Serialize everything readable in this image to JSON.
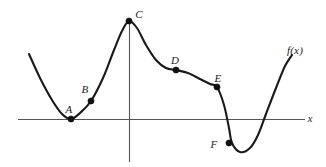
{
  "figure": {
    "background_color": "#ffffff",
    "curve_color": "#1a1a1a",
    "axis_color": "#555555",
    "point_color": "#111111",
    "function_label": "f(x)",
    "function_label_pos": {
      "x": 295,
      "y": 50
    },
    "x_axis_label": "x",
    "x_axis_label_pos": {
      "x": 310,
      "y": 119
    }
  },
  "chart_data": {
    "type": "line",
    "title": "",
    "xlabel": "x",
    "ylabel": "",
    "grid": false,
    "legend": "none",
    "series": [
      {
        "name": "f(x)",
        "description": "Smooth continuous curve descending steeply from upper left to a local minimum at A on the x-axis, rising through inflection point B to a local maximum at C on the y-axis, falling through inflection D to a plateau, descending through inflection E to a local minimum below the axis near F, then rising steeply to the upper right.",
        "points": [
          {
            "x": 29,
            "y": 54
          },
          {
            "x": 40,
            "y": 78
          },
          {
            "x": 52,
            "y": 100
          },
          {
            "x": 62,
            "y": 114
          },
          {
            "x": 71,
            "y": 119
          },
          {
            "x": 80,
            "y": 113
          },
          {
            "x": 91,
            "y": 101
          },
          {
            "x": 103,
            "y": 78
          },
          {
            "x": 114,
            "y": 50
          },
          {
            "x": 122,
            "y": 31
          },
          {
            "x": 129,
            "y": 21
          },
          {
            "x": 137,
            "y": 28
          },
          {
            "x": 146,
            "y": 45
          },
          {
            "x": 156,
            "y": 60
          },
          {
            "x": 166,
            "y": 68
          },
          {
            "x": 176,
            "y": 70
          },
          {
            "x": 188,
            "y": 73
          },
          {
            "x": 200,
            "y": 79
          },
          {
            "x": 210,
            "y": 84
          },
          {
            "x": 217,
            "y": 87
          },
          {
            "x": 224,
            "y": 105
          },
          {
            "x": 229,
            "y": 128
          },
          {
            "x": 232,
            "y": 143
          },
          {
            "x": 240,
            "y": 152
          },
          {
            "x": 250,
            "y": 148
          },
          {
            "x": 258,
            "y": 135
          },
          {
            "x": 266,
            "y": 114
          },
          {
            "x": 276,
            "y": 88
          },
          {
            "x": 285,
            "y": 66
          },
          {
            "x": 292,
            "y": 55
          }
        ]
      }
    ],
    "marked_points": [
      {
        "label": "A",
        "x": 71,
        "y": 119,
        "label_x": 69,
        "label_y": 109
      },
      {
        "label": "B",
        "x": 91,
        "y": 101,
        "label_x": 85,
        "label_y": 89
      },
      {
        "label": "C",
        "x": 129,
        "y": 21,
        "label_x": 139,
        "label_y": 14
      },
      {
        "label": "D",
        "x": 176,
        "y": 70,
        "label_x": 175,
        "label_y": 60
      },
      {
        "label": "E",
        "x": 217,
        "y": 87,
        "label_x": 218,
        "label_y": 78
      },
      {
        "label": "F",
        "x": 229,
        "y": 143,
        "label_x": 214,
        "label_y": 144
      }
    ],
    "axes": {
      "x_axis": {
        "x1": 18,
        "y1": 119.5,
        "x2": 305,
        "y2": 119.5
      },
      "y_axis": {
        "x1": 129.5,
        "y1": 21,
        "x2": 129.5,
        "y2": 162
      }
    }
  }
}
